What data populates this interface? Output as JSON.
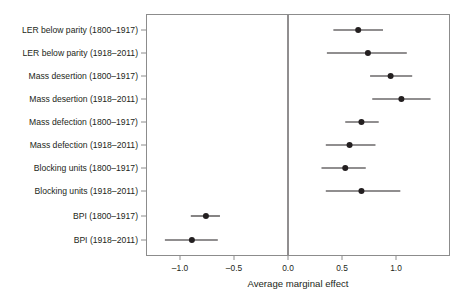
{
  "chart_data": {
    "type": "scatter",
    "title": "",
    "subtitle": "",
    "xlabel": "Average marginal effect",
    "ylabel": "",
    "xlim": [
      -1.3,
      1.5
    ],
    "ylim": [
      0,
      11
    ],
    "grid": false,
    "legend": "none",
    "orientation": "horizontal",
    "plot_style": "forest-plot",
    "reference_line_x": 0.0,
    "x_ticks": [
      -1.0,
      -0.5,
      0.0,
      0.5,
      1.0
    ],
    "x_tick_labels": [
      "–1.0",
      "–0.5",
      "0.0",
      "0.5",
      "1.0"
    ],
    "categories": [
      "LER below parity (1800–1917)",
      "LER below parity (1918–2011)",
      "Mass desertion (1800–1917)",
      "Mass desertion (1918–2011)",
      "Mass defection (1800–1917)",
      "Mass defection (1918–2011)",
      "Blocking units (1800–1917)",
      "Blocking units (1918–2011)",
      "BPI (1800–1917)",
      "BPI (1918–2011)"
    ],
    "values": [
      0.65,
      0.74,
      0.95,
      1.05,
      0.68,
      0.57,
      0.53,
      0.68,
      -0.76,
      -0.89
    ],
    "ci_low": [
      0.42,
      0.36,
      0.76,
      0.78,
      0.53,
      0.35,
      0.31,
      0.35,
      -0.9,
      -1.14
    ],
    "ci_high": [
      0.88,
      1.1,
      1.15,
      1.32,
      0.84,
      0.81,
      0.72,
      1.04,
      -0.63,
      -0.65
    ],
    "point_color": "#231f20",
    "line_color": "#231f20",
    "frame_color": "#8c8c8c",
    "background_color": "#ffffff"
  }
}
